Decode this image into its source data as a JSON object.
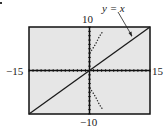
{
  "chart_data": {
    "type": "line",
    "title": "",
    "xlabel": "",
    "ylabel": "",
    "xlim": [
      -15,
      15
    ],
    "ylim": [
      -10,
      10
    ],
    "grid": false,
    "tick_labels": {
      "xmin": "−15",
      "xmax": "15",
      "ymin": "−10",
      "ymax": "10"
    },
    "annotation": {
      "text": "y = x",
      "arrow_to": [
        13,
        8
      ]
    },
    "series": [
      {
        "name": "y = x",
        "style": "solid",
        "x": [
          -15,
          15
        ],
        "y": [
          -10,
          10
        ]
      },
      {
        "name": "curve upper branch",
        "style": "dotted",
        "x": [
          0,
          0.5,
          1,
          1.5,
          2,
          2.5,
          3.3
        ],
        "y": [
          4,
          4.6,
          5.3,
          6.1,
          7.0,
          7.9,
          9.0
        ]
      },
      {
        "name": "curve lower branch",
        "style": "dotted",
        "x": [
          0,
          0.5,
          1,
          1.5,
          2,
          2.5,
          3.3
        ],
        "y": [
          -4,
          -4.6,
          -5.3,
          -6.1,
          -7.0,
          -7.9,
          -9.0
        ]
      }
    ],
    "colors": {
      "background": "#e6e6e6",
      "axes": "#111111",
      "line": "#1a1a1a"
    }
  },
  "labels": {
    "ymax": "10",
    "ymin": "−10",
    "xmin": "−15",
    "xmax": "15",
    "annotation": "y = x"
  }
}
